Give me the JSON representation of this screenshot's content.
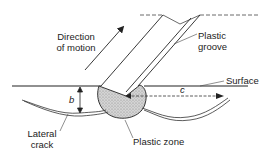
{
  "diagram": {
    "labels": {
      "direction_line1": "Direction",
      "direction_line2": "of motion",
      "groove_line1": "Plastic",
      "groove_line2": "groove",
      "surface": "Surface",
      "b": "b",
      "c": "c",
      "crack_line1": "Lateral",
      "crack_line2": "crack",
      "plastic_zone": "Plastic zone"
    },
    "colors": {
      "line": "#222222",
      "zone_fill": "#c8c8c8",
      "background": "#ffffff"
    }
  }
}
